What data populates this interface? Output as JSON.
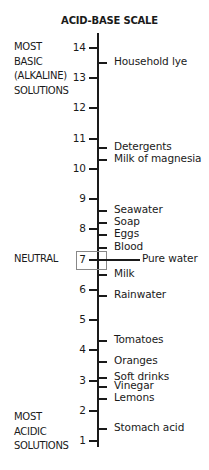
{
  "title": "ACID-BASE SCALE",
  "side_labels": {
    "basic": [
      "MOST",
      "BASIC",
      "(ALKALINE)",
      "SOLUTIONS"
    ],
    "neutral": "NEUTRAL",
    "acidic": [
      "MOST",
      "ACIDIC",
      "SOLUTIONS"
    ]
  },
  "scale": {
    "min": 1,
    "max": 14,
    "ticks": [
      "14",
      "13",
      "12",
      "11",
      "10",
      "9",
      "8",
      "7",
      "6",
      "5",
      "4",
      "3",
      "2",
      "1"
    ],
    "highlighted": "7"
  },
  "items": [
    {
      "label": "Household lye",
      "ph": 13.5
    },
    {
      "label": "Detergents",
      "ph": 10.7
    },
    {
      "label": "Milk of magnesia",
      "ph": 10.3
    },
    {
      "label": "Seawater",
      "ph": 8.6
    },
    {
      "label": "Soap",
      "ph": 8.2
    },
    {
      "label": "Eggs",
      "ph": 7.8
    },
    {
      "label": "Blood",
      "ph": 7.4
    },
    {
      "label": "Pure water",
      "ph": 7.0
    },
    {
      "label": "Milk",
      "ph": 6.5
    },
    {
      "label": "Rainwater",
      "ph": 5.8
    },
    {
      "label": "Tomatoes",
      "ph": 4.3
    },
    {
      "label": "Oranges",
      "ph": 3.6
    },
    {
      "label": "Soft drinks",
      "ph": 3.1
    },
    {
      "label": "Vinegar",
      "ph": 2.8
    },
    {
      "label": "Lemons",
      "ph": 2.4
    },
    {
      "label": "Stomach acid",
      "ph": 1.4
    }
  ]
}
